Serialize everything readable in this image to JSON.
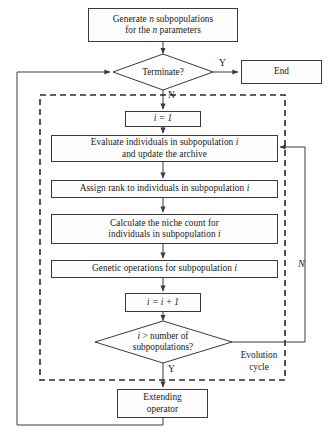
{
  "diagram": {
    "colors": {
      "stroke": "#3a3a3a",
      "text": "#1a1a1a",
      "background": "#ffffff",
      "dashed_region": "#2b2b2b"
    },
    "nodes": {
      "generate": {
        "type": "process",
        "line1": "Generate n subpopulations",
        "line2": "for the n parameters"
      },
      "terminate": {
        "type": "decision",
        "label": "Terminate?"
      },
      "end": {
        "type": "process",
        "label": "End"
      },
      "init_i": {
        "type": "process",
        "label": "i = 1"
      },
      "evaluate": {
        "type": "process",
        "line1": "Evaluate individuals in subpopulation i",
        "line2": "and update the archive"
      },
      "assign_rank": {
        "type": "process",
        "label": "Assign rank to individuals in subpopulation i"
      },
      "niche_count": {
        "type": "process",
        "line1": "Calculate the niche count for",
        "line2": "individuals in subpopulation i"
      },
      "genetic_ops": {
        "type": "process",
        "label": "Genetic operations for subpopulation i"
      },
      "increment_i": {
        "type": "process",
        "label": "i = i + 1"
      },
      "check_i": {
        "type": "decision",
        "line1": "i > number of",
        "line2": "subpopulations?"
      },
      "extending": {
        "type": "process",
        "line1": "Extending",
        "line2": "operator"
      }
    },
    "edge_labels": {
      "terminate_yes": "Y",
      "terminate_no": "N",
      "check_yes": "Y",
      "check_no": "N"
    },
    "region_labels": {
      "evolution_cycle_line1": "Evolution",
      "evolution_cycle_line2": "cycle"
    }
  }
}
